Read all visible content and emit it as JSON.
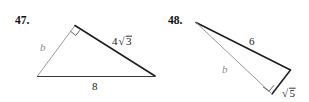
{
  "page": {
    "background_color": "#ffffff",
    "ink_color": "#1c1c1c",
    "faint_ink_color": "#9a9a9a"
  },
  "exercises": [
    {
      "number": "47.",
      "figure_type": "right-triangle",
      "right_angle_at": "apex",
      "labels": {
        "leg_unknown": "b",
        "leg_known": "4√3",
        "hypotenuse": "8"
      },
      "radical_parts": {
        "coefficient": "4",
        "radical_sign": "√",
        "radicand": "3"
      }
    },
    {
      "number": "48.",
      "figure_type": "right-triangle",
      "right_angle_at": "bottom-vertex",
      "labels": {
        "hypotenuse": "6",
        "leg_unknown": "b",
        "leg_known": "√5"
      },
      "radical_parts": {
        "coefficient": "",
        "radical_sign": "√",
        "radicand": "5"
      }
    }
  ]
}
